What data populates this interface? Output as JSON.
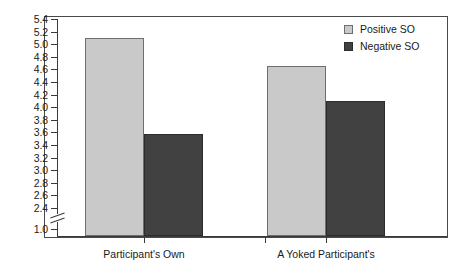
{
  "chart_data": {
    "type": "bar",
    "title": "",
    "xlabel": "",
    "ylabel": "",
    "categories": [
      "Participant's Own",
      "A Yoked Participant's"
    ],
    "series": [
      {
        "name": "Positive SO",
        "color": "#c9c9c9",
        "values": [
          5.1,
          4.65
        ]
      },
      {
        "name": "Negative SO",
        "color": "#414141",
        "values": [
          3.57,
          4.1
        ]
      }
    ],
    "ylim": [
      1.0,
      5.4
    ],
    "axis_break": {
      "between": [
        1.0,
        2.4
      ],
      "present": true
    },
    "y_ticks": [
      "5.4",
      "5.2",
      "5.0",
      "4.8",
      "4.6",
      "4.4",
      "4.2",
      "4.0",
      "3.8",
      "3.6",
      "3.4",
      "3.2",
      "3.0",
      "2.8",
      "2.6",
      "2.4",
      "1.0"
    ],
    "grid": false,
    "legend_position": "top-right",
    "legend_entries": [
      "Positive SO",
      "Negative SO"
    ]
  }
}
